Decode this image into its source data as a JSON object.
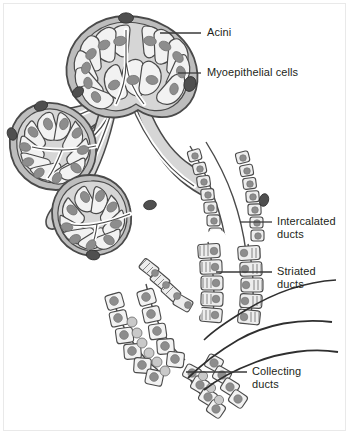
{
  "figure": {
    "kind": "anatomical-diagram",
    "background_color": "#ffffff",
    "frame_color": "#e9e9e9"
  },
  "palette": {
    "outline": "#4a4a4a",
    "outline_dark": "#2f2f2f",
    "stroma": "#d6d6d6",
    "capsule": "#bdbdbd",
    "cell_fill": "#f2f2f2",
    "cell_fill_alt": "#ededed",
    "nucleus": "#8d8d8d",
    "nucleus_dark": "#6f6f6f",
    "myoepithelial": "#4f4f4f",
    "lumen": "#ffffff",
    "leader": "#3a3a3a",
    "text": "#231f20"
  },
  "labels": [
    {
      "id": "acini",
      "text": "Acini",
      "text_x": 207,
      "text_y": 26,
      "leader": {
        "x1": 160,
        "y1": 33,
        "x2": 201,
        "y2": 33
      }
    },
    {
      "id": "myoepithelial-cells",
      "text": "Myoepithelial cells",
      "text_x": 207,
      "text_y": 66,
      "leader": {
        "x1": 178,
        "y1": 73,
        "x2": 201,
        "y2": 73
      }
    },
    {
      "id": "intercalated-ducts",
      "text": "Intercalated\nducts",
      "text_x": 277,
      "text_y": 215,
      "leader": {
        "x1": 240,
        "y1": 222,
        "x2": 272,
        "y2": 222
      }
    },
    {
      "id": "striated-ducts",
      "text": "Striated\nducts",
      "text_x": 277,
      "text_y": 265,
      "leader": {
        "x1": 216,
        "y1": 272,
        "x2": 272,
        "y2": 272
      }
    },
    {
      "id": "collecting-ducts",
      "text": "Collecting\nducts",
      "text_x": 252,
      "text_y": 365,
      "leader": {
        "x1": 186,
        "y1": 372,
        "x2": 247,
        "y2": 372
      }
    }
  ],
  "structures": [
    {
      "id": "acinus-top",
      "name": "Acinus (top)",
      "cells": 12
    },
    {
      "id": "acinus-left",
      "name": "Acinus (left)",
      "cells": 11
    },
    {
      "id": "acinus-lower-left",
      "name": "Acinus (lower left)",
      "cells": 10
    },
    {
      "id": "duct-trunk",
      "name": "Branching duct trunk",
      "cells": 0
    },
    {
      "id": "intercalated-duct",
      "name": "Intercalated duct",
      "cells": 18
    },
    {
      "id": "striated-duct",
      "name": "Striated duct",
      "cells": 22
    },
    {
      "id": "collecting-duct-left",
      "name": "Collecting duct (left)",
      "cells": 16
    },
    {
      "id": "collecting-duct-right",
      "name": "Collecting duct (right)",
      "cells": 12
    }
  ]
}
